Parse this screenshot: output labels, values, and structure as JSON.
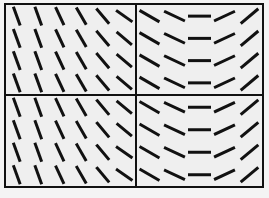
{
  "figure": {
    "frame_color": "#111111",
    "background": "#efefef",
    "segment_color": "#111111",
    "quadrants": [
      {
        "id": "top-left",
        "pattern": "oblique",
        "rows": 4,
        "cols": 6,
        "angles_deg": [
          [
            -70,
            -70,
            -65,
            -60,
            -50,
            -35
          ],
          [
            -70,
            -70,
            -65,
            -60,
            -50,
            -40
          ],
          [
            -70,
            -70,
            -65,
            -60,
            -50,
            -40
          ],
          [
            -70,
            -70,
            -65,
            -60,
            -50,
            -40
          ]
        ]
      },
      {
        "id": "top-right",
        "pattern": "curved-arc",
        "rows": 4,
        "cols": 5,
        "angles_deg": [
          [
            -30,
            -25,
            0,
            25,
            40
          ],
          [
            -30,
            -25,
            0,
            25,
            40
          ],
          [
            -30,
            -25,
            0,
            25,
            40
          ],
          [
            -30,
            -25,
            0,
            25,
            40
          ]
        ]
      },
      {
        "id": "bottom-left",
        "pattern": "oblique",
        "rows": 4,
        "cols": 6,
        "angles_deg": [
          [
            -70,
            -70,
            -65,
            -60,
            -50,
            -40
          ],
          [
            -70,
            -70,
            -65,
            -60,
            -50,
            -40
          ],
          [
            -70,
            -70,
            -65,
            -60,
            -50,
            -35
          ],
          [
            -70,
            -70,
            -65,
            -60,
            -50,
            -35
          ]
        ]
      },
      {
        "id": "bottom-right",
        "pattern": "curved-arc",
        "rows": 4,
        "cols": 5,
        "angles_deg": [
          [
            -30,
            -25,
            0,
            25,
            40
          ],
          [
            -30,
            -25,
            0,
            25,
            40
          ],
          [
            -30,
            -25,
            0,
            25,
            40
          ],
          [
            -30,
            -25,
            0,
            25,
            40
          ]
        ]
      }
    ]
  }
}
